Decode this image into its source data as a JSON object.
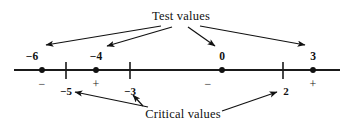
{
  "figure": {
    "type": "number-line-sign-chart",
    "width": 350,
    "height": 130,
    "axis_y": 70,
    "axis_x_start": 14,
    "axis_x_end": 340,
    "line_color": "#1a1a1a",
    "text_color": "#111111"
  },
  "annotations": {
    "test_values_label": "Test values",
    "critical_values_label": "Critical values"
  },
  "test_values": [
    {
      "label": "−6",
      "value": -6,
      "x": 42,
      "sign_region": "−"
    },
    {
      "label": "−4",
      "value": -4,
      "x": 96,
      "sign_region": "+"
    },
    {
      "label": "0",
      "value": 0,
      "x": 222,
      "sign_region": "−"
    },
    {
      "label": "3",
      "value": 3,
      "x": 313,
      "sign_region": "+"
    }
  ],
  "critical_values": [
    {
      "label": "−5",
      "value": -5,
      "x": 66
    },
    {
      "label": "−3",
      "value": -3,
      "x": 130
    },
    {
      "label": "2",
      "value": 2,
      "x": 283
    }
  ],
  "sign_labels": [
    {
      "sign": "−",
      "x": 42
    },
    {
      "sign": "+",
      "x": 96
    },
    {
      "sign": "−",
      "x": 208
    },
    {
      "sign": "+",
      "x": 313
    }
  ]
}
